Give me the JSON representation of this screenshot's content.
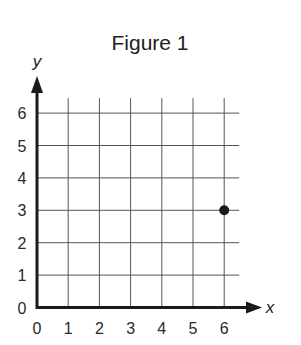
{
  "chart_data": {
    "type": "scatter",
    "title": "Figure 1",
    "xlabel": "x",
    "ylabel": "y",
    "xlim": [
      0,
      6
    ],
    "ylim": [
      0,
      6
    ],
    "x_ticks": [
      "0",
      "1",
      "2",
      "3",
      "4",
      "5",
      "6"
    ],
    "y_ticks": [
      "0",
      "1",
      "2",
      "3",
      "4",
      "5",
      "6"
    ],
    "grid": true,
    "series": [
      {
        "name": "point",
        "points": [
          {
            "x": 6,
            "y": 3
          }
        ]
      }
    ],
    "colors": {
      "axis": "#1a1a1a",
      "grid": "#555555",
      "point": "#1a1a1a"
    }
  }
}
